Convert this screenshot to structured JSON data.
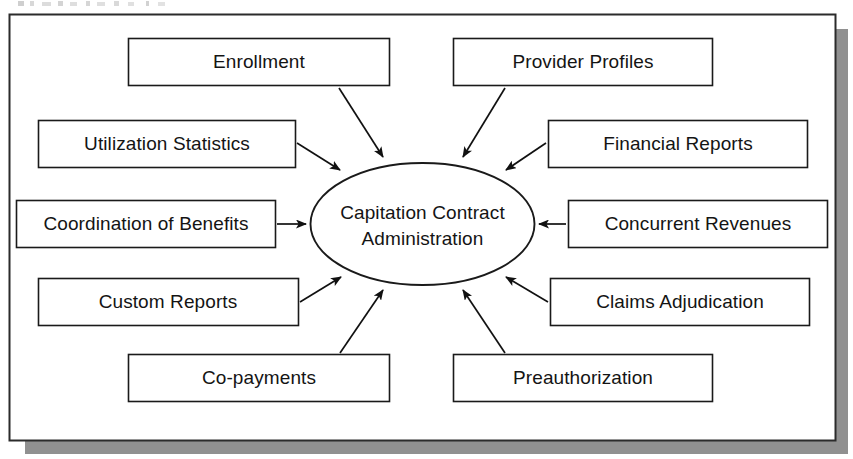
{
  "document": {
    "caption_fragment": "",
    "background_color": "#ffffff",
    "frame": {
      "stroke_color": "#2b2b2b",
      "fill_color": "#ffffff",
      "shadow_color": "#909090"
    }
  },
  "diagram": {
    "type": "hub-and-spoke",
    "hub": {
      "shape": "ellipse",
      "line_1": "Capitation Contract",
      "line_2": "Administration",
      "full_label": "Capitation Contract Administration"
    },
    "arrow_direction": "inward",
    "stroke_color": "#1a1a1a",
    "node_fill": "#ffffff",
    "nodes": [
      {
        "id": "enrollment",
        "label": "Enrollment",
        "position": "top-left"
      },
      {
        "id": "provider-profiles",
        "label": "Provider Profiles",
        "position": "top-right"
      },
      {
        "id": "utilization-statistics",
        "label": "Utilization Statistics",
        "position": "upper-left"
      },
      {
        "id": "financial-reports",
        "label": "Financial Reports",
        "position": "upper-right"
      },
      {
        "id": "coordination-of-benefits",
        "label": "Coordination of Benefits",
        "position": "middle-left"
      },
      {
        "id": "concurrent-revenues",
        "label": "Concurrent Revenues",
        "position": "middle-right"
      },
      {
        "id": "custom-reports",
        "label": "Custom Reports",
        "position": "lower-left"
      },
      {
        "id": "claims-adjudication",
        "label": "Claims Adjudication",
        "position": "lower-right"
      },
      {
        "id": "co-payments",
        "label": "Co-payments",
        "position": "bottom-left"
      },
      {
        "id": "preauthorization",
        "label": "Preauthorization",
        "position": "bottom-right"
      }
    ]
  }
}
